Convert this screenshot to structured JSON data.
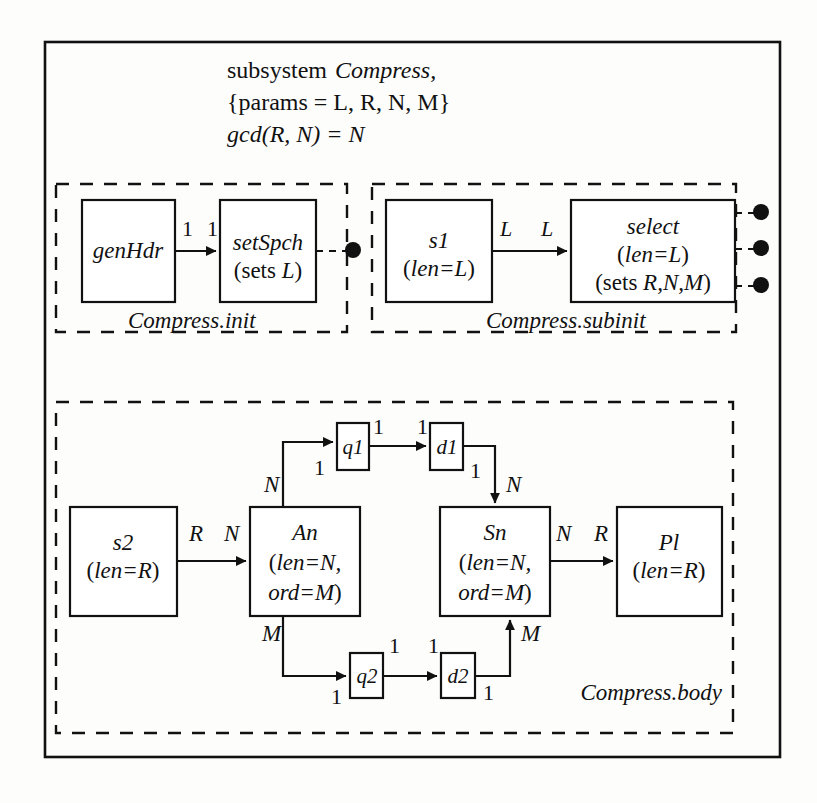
{
  "diagram": {
    "type": "block-dataflow-diagram",
    "header": {
      "line1_plain": "subsystem ",
      "line1_italic": "Compress,",
      "line2": "{params = L, R, N, M}",
      "line3_italic": "gcd",
      "line3_rest": "(R, N) = N"
    },
    "groups": {
      "init": {
        "label": "Compress.init"
      },
      "subinit": {
        "label": "Compress.subinit"
      },
      "body": {
        "label": "Compress.body"
      }
    },
    "blocks": {
      "genHdr": {
        "name": "genHdr",
        "sub": ""
      },
      "setSpch": {
        "name": "setSpch",
        "sub": "(sets L)"
      },
      "s1": {
        "name": "s1",
        "sub": "(len=L)"
      },
      "select": {
        "name": "select",
        "sub1": "(len=L)",
        "sub2": "(sets R,N,M)"
      },
      "s2": {
        "name": "s2",
        "sub": "(len=R)"
      },
      "An": {
        "name": "An",
        "sub1": "(len=N,",
        "sub2": "ord=M)"
      },
      "Sn": {
        "name": "Sn",
        "sub1": "(len=N,",
        "sub2": "ord=M)"
      },
      "Pl": {
        "name": "Pl",
        "sub": "(len=R)"
      },
      "q1": {
        "name": "q1"
      },
      "d1": {
        "name": "d1"
      },
      "q2": {
        "name": "q2"
      },
      "d2": {
        "name": "d2"
      }
    },
    "edge_labels": {
      "genHdr_out": "1",
      "setSpch_in": "1",
      "s1_out": "L",
      "select_in": "L",
      "s2_out": "R",
      "An_in": "N",
      "An_top_out": "N",
      "q1_in": "1",
      "q1_out": "1",
      "d1_in": "1",
      "d1_out": "1",
      "Sn_top_in": "N",
      "Sn_out": "N",
      "Pl_in": "R",
      "An_bot_out": "M",
      "q2_in": "1",
      "q2_out": "1",
      "d2_in": "1",
      "d2_out": "1",
      "Sn_bot_in": "M"
    },
    "ports": {
      "init_dot_count": 1,
      "subinit_dot_count": 3
    },
    "colors": {
      "stroke": "#111111",
      "background": "#fdfdfc",
      "text": "#111111"
    }
  }
}
